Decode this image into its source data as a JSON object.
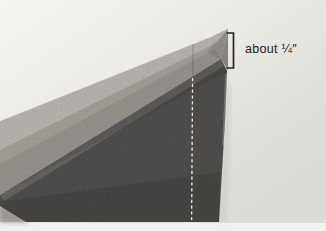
{
  "page": {
    "background": "#f2f1ec"
  },
  "photo": {
    "background": "#e8e6e1",
    "regions": {
      "binding_strip": "#b2afa7",
      "binding_strip_fold": "#cac7c0",
      "binding_edge": "#98958e",
      "dark_fabric": "#363432",
      "corner_shadow": "#b7b4ad"
    },
    "stitch": {
      "color": "#ece9e0"
    },
    "annotation": {
      "label": "about ¼″",
      "bracket_color": "#232323",
      "text_color": "#1b1b1b"
    }
  }
}
